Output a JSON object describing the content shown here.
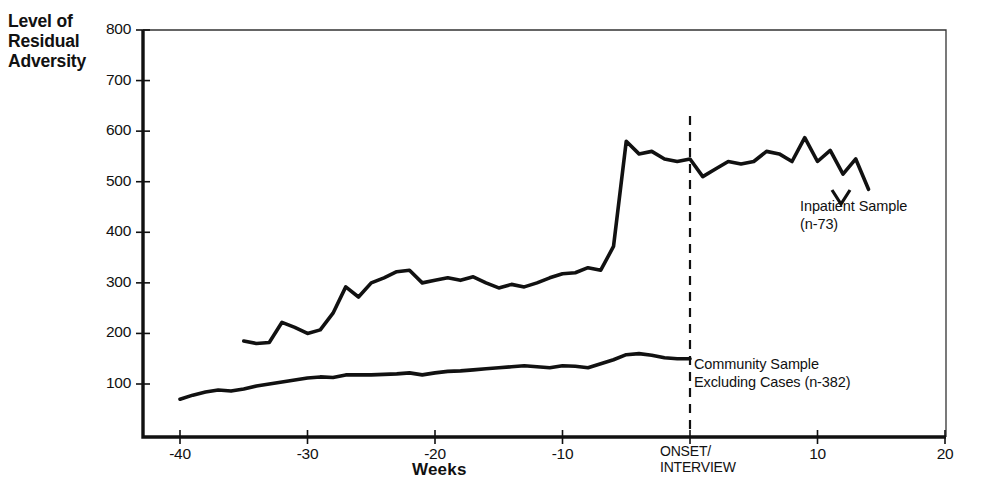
{
  "chart_data": {
    "type": "line",
    "title": "",
    "xlabel": "Weeks",
    "ylabel": "Level of\nResidual\nAdversity",
    "xlim": [
      -42,
      20
    ],
    "ylim": [
      0,
      800
    ],
    "grid": false,
    "legend_position": "inline-annotations",
    "x_ticks": [
      -40,
      -30,
      -20,
      -10,
      0,
      10,
      20
    ],
    "x_tick_labels": [
      "-40",
      "-30",
      "-20",
      "-10",
      "",
      "10",
      "20"
    ],
    "y_ticks": [
      100,
      200,
      300,
      400,
      500,
      600,
      700,
      800
    ],
    "y_tick_labels": [
      "100",
      "200",
      "300",
      "400",
      "500",
      "600",
      "700",
      "800"
    ],
    "annotations": [
      {
        "name": "onset-marker",
        "text": "ONSET/\nINTERVIEW",
        "x": 0
      },
      {
        "name": "inpatient-annotation",
        "text": "Inpatient Sample\n(n-73)"
      },
      {
        "name": "community-annotation",
        "text": "Community Sample\nExcluding Cases  (n-382)"
      }
    ],
    "vertical_reference_line": {
      "x": 0,
      "style": "dashed",
      "color": "#111111"
    },
    "series": [
      {
        "name": "Inpatient Sample",
        "label": "Inpatient Sample (n-73)",
        "n": 73,
        "color": "#111111",
        "x": [
          -35,
          -34,
          -33,
          -32,
          -31,
          -30,
          -29,
          -28,
          -27,
          -26,
          -25,
          -24,
          -23,
          -22,
          -21,
          -20,
          -19,
          -18,
          -17,
          -16,
          -15,
          -14,
          -13,
          -12,
          -11,
          -10,
          -9,
          -8,
          -7,
          -6,
          -5,
          -4,
          -3,
          -2,
          -1,
          0,
          1,
          2,
          3,
          4,
          5,
          6,
          7,
          8,
          9,
          10,
          11,
          12,
          13,
          14
        ],
        "values": [
          185,
          180,
          182,
          222,
          212,
          200,
          207,
          240,
          292,
          272,
          300,
          310,
          322,
          325,
          300,
          305,
          310,
          305,
          312,
          300,
          290,
          297,
          292,
          300,
          310,
          318,
          320,
          330,
          325,
          372,
          580,
          555,
          560,
          545,
          540,
          545,
          510,
          525,
          540,
          535,
          540,
          560,
          555,
          540,
          587,
          540,
          562,
          515,
          545,
          485
        ]
      },
      {
        "name": "Community Sample Excluding Cases",
        "label": "Community Sample Excluding Cases (n-382)",
        "n": 382,
        "color": "#111111",
        "x": [
          -40,
          -39,
          -38,
          -37,
          -36,
          -35,
          -34,
          -33,
          -32,
          -31,
          -30,
          -29,
          -28,
          -27,
          -26,
          -25,
          -24,
          -23,
          -22,
          -21,
          -20,
          -19,
          -18,
          -17,
          -16,
          -15,
          -14,
          -13,
          -12,
          -11,
          -10,
          -9,
          -8,
          -7,
          -6,
          -5,
          -4,
          -3,
          -2,
          -1,
          0
        ],
        "values": [
          70,
          78,
          84,
          88,
          86,
          90,
          96,
          100,
          104,
          108,
          112,
          114,
          113,
          118,
          118,
          118,
          119,
          120,
          122,
          118,
          122,
          125,
          126,
          128,
          130,
          132,
          134,
          136,
          134,
          132,
          136,
          135,
          132,
          140,
          148,
          158,
          160,
          157,
          152,
          150,
          150
        ]
      }
    ]
  },
  "axis": {
    "ylabel_text": "Level of\nResidual\nAdversity",
    "xlabel_text": "Weeks",
    "onset_text": "ONSET/\nINTERVIEW"
  },
  "annotations": {
    "inpatient": "Inpatient Sample\n(n-73)",
    "community": "Community Sample\nExcluding Cases  (n-382)"
  }
}
